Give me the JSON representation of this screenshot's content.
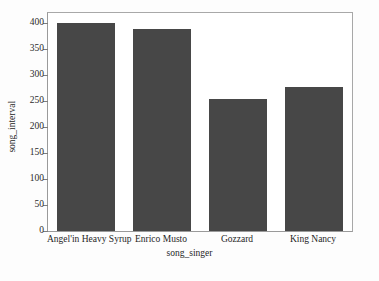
{
  "chart_data": {
    "type": "bar",
    "title": "",
    "xlabel": "song_singer",
    "ylabel": "song_interval",
    "categories": [
      "Angel'in Heavy Syrup",
      "Enrico Musto",
      "Gozzard",
      "King Nancy"
    ],
    "values": [
      400,
      389,
      255,
      277
    ],
    "ylim": [
      0,
      420
    ],
    "yticks": [
      0,
      50,
      100,
      150,
      200,
      250,
      300,
      350,
      400
    ],
    "ytick_labels": [
      "0",
      "50",
      "100",
      "150",
      "200",
      "250",
      "300",
      "350",
      "400"
    ],
    "grid": false,
    "legend": false,
    "bar_color": "#474747",
    "background_color": "#ffffff",
    "axes_color": "#9a9a9a"
  }
}
